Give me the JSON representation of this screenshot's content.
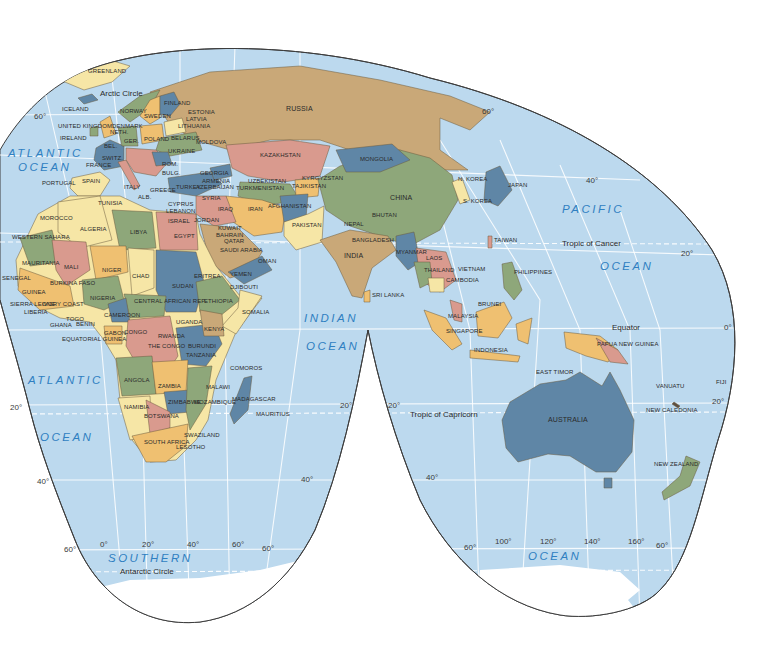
{
  "map": {
    "projection": "interrupted-homolosine",
    "colors": {
      "ocean": "#bcd9ee",
      "background": "#ffffff",
      "outline": "#3d3d3d",
      "tan": "#c9a878",
      "green": "#8ea77a",
      "blue": "#5f86a6",
      "pink": "#d99a8e",
      "yellow": "#f6e6a6",
      "orange": "#efc071",
      "ice": "#ffffff",
      "ocean_label": "#2f7fc1"
    },
    "oceans": {
      "atlantic_north": [
        "ATLANTIC",
        "OCEAN"
      ],
      "atlantic_south": [
        "ATLANTIC",
        "OCEAN"
      ],
      "pacific": [
        "PACIFIC",
        "OCEAN"
      ],
      "indian": [
        "INDIAN",
        "OCEAN"
      ],
      "southern": [
        "SOUTHERN",
        "OCEAN"
      ]
    },
    "lines": {
      "arctic_circle": "Arctic Circle",
      "tropic_cancer": "Tropic of Cancer",
      "equator": "Equator",
      "tropic_capricorn": "Tropic of Capricorn",
      "antarctic_circle": "Antarctic Circle"
    },
    "degrees": {
      "lat_60n_w": "60°",
      "lat_60n_e": "60°",
      "lat_40n": "40°",
      "lat_20n": "20°",
      "lat_0": "0°",
      "lat_20s_w": "20°",
      "lat_20s_m": "20°",
      "lat_20s_iw": "20°",
      "lat_20s_e": "20°",
      "lat_40s_w": "40°",
      "lat_40s_m": "40°",
      "lat_40s_iw": "40°",
      "lat_60s_w": "60°",
      "lat_60s_m": "60°",
      "lat_60s_iw": "60°",
      "lat_60s_e": "60°",
      "lon_0": "0°",
      "lon_20": "20°",
      "lon_40": "40°",
      "lon_60": "60°",
      "lon_100": "100°",
      "lon_120": "120°",
      "lon_140": "140°",
      "lon_160": "160°"
    },
    "countries": {
      "greenland": "GREENLAND",
      "iceland": "ICELAND",
      "norway": "NORWAY",
      "sweden": "SWEDEN",
      "finland": "FINLAND",
      "estonia": "ESTONIA",
      "latvia": "LATVIA",
      "lithuania": "LITHUANIA",
      "uk": "UNITED KINGDOM",
      "ireland": "IRELAND",
      "denmark": "DENMARK",
      "neth": "NETH.",
      "bel": "BEL.",
      "ger": "GER.",
      "poland": "POLAND",
      "belarus": "BELARUS",
      "ukraine": "UKRAINE",
      "moldova": "MOLDOVA",
      "france": "FRANCE",
      "switz": "SWITZ.",
      "rom": "ROM.",
      "bulg": "BULG.",
      "italy": "ITALY",
      "alb": "ALB.",
      "greece": "GREECE",
      "portugal": "PORTUGAL",
      "spain": "SPAIN",
      "russia": "RUSSIA",
      "kazakhstan": "KAZAKHSTAN",
      "mongolia": "MONGOLIA",
      "china": "CHINA",
      "nkorea": "N. KOREA",
      "skorea": "S. KOREA",
      "japan": "JAPAN",
      "georgia": "GEORGIA",
      "armenia": "ARMENIA",
      "azerbaijan": "AZERBAIJAN",
      "turkey": "TURKEY",
      "uzbekistan": "UZBEKISTAN",
      "turkmenistan": "TURKMENISTAN",
      "kyrgyzstan": "KYRGYZSTAN",
      "tajikistan": "TAJIKISTAN",
      "cyprus": "CYPRUS",
      "lebanon": "LEBANON",
      "syria": "SYRIA",
      "iraq": "IRAQ",
      "iran": "IRAN",
      "afghanistan": "AFGHANISTAN",
      "pakistan": "PAKISTAN",
      "israel": "ISRAEL",
      "jordan": "JORDAN",
      "kuwait": "KUWAIT",
      "bahrain": "BAHRAIN",
      "qatar": "QATAR",
      "saudi": "SAUDI ARABIA",
      "uae": "U.A.E.",
      "oman": "OMAN",
      "yemen": "YEMEN",
      "nepal": "NEPAL",
      "bhutan": "BHUTAN",
      "bangladesh": "BANGLADESH",
      "india": "INDIA",
      "myanmar": "MYANMAR",
      "laos": "LAOS",
      "thailand": "THAILAND",
      "vietnam": "VIETNAM",
      "cambodia": "CAMBODIA",
      "taiwan": "TAIWAN",
      "philippines": "PHILIPPINES",
      "srilanka": "SRI LANKA",
      "brunei": "BRUNEI",
      "malaysia": "MALAYSIA",
      "singapore": "SINGAPORE",
      "indonesia": "INDONESIA",
      "easttimor": "EAST TIMOR",
      "png": "PAPUA NEW GUINEA",
      "australia": "AUSTRALIA",
      "vanuatu": "VANUATU",
      "fiji": "FIJI",
      "newcaledonia": "NEW CALEDONIA",
      "newzealand": "NEW ZEALAND",
      "tunisia": "TUNISIA",
      "morocco": "MOROCCO",
      "algeria": "ALGERIA",
      "libya": "LIBYA",
      "egypt": "EGYPT",
      "westernsahara": "WESTERN SAHARA",
      "mauritania": "MAURITANIA",
      "mali": "MALI",
      "niger": "NIGER",
      "chad": "CHAD",
      "sudan": "SUDAN",
      "eritrea": "ERITREA",
      "djibouti": "DJIBOUTI",
      "senegal": "SENEGAL",
      "gambia": "GAMBIA",
      "guineabissau": "GUINEA-BISSAU",
      "guinea": "GUINEA",
      "sierraleone": "SIERRA LEONE",
      "liberia": "LIBERIA",
      "burkinafaso": "BURKINA FASO",
      "ivorycoast": "IVORY COAST",
      "ghana": "GHANA",
      "togo": "TOGO",
      "benin": "BENIN",
      "nigeria": "NIGERIA",
      "car": "CENTRAL AFRICAN REP.",
      "ethiopia": "ETHIOPIA",
      "somalia": "SOMALIA",
      "cameroon": "CAMEROON",
      "eqguinea": "EQUATORIAL GUINEA",
      "gabon": "GABON",
      "congo": "CONGO",
      "drc": "THE CONGO",
      "uganda": "UGANDA",
      "kenya": "KENYA",
      "rwanda": "RWANDA",
      "burundi": "BURUNDI",
      "tanzania": "TANZANIA",
      "comoros": "COMOROS",
      "angola": "ANGOLA",
      "zambia": "ZAMBIA",
      "malawi": "MALAWI",
      "zimbabwe": "ZIMBABWE",
      "mozambique": "MOZAMBIQUE",
      "madagascar": "MADAGASCAR",
      "mauritius": "MAURITIUS",
      "namibia": "NAMIBIA",
      "botswana": "BOTSWANA",
      "swaziland": "SWAZILAND",
      "southafrica": "SOUTH AFRICA",
      "lesotho": "LESOTHO"
    }
  }
}
